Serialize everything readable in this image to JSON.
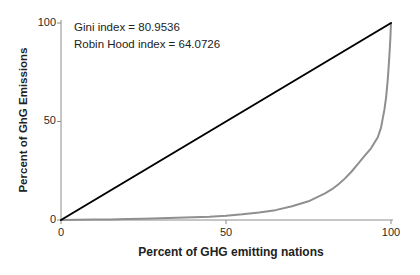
{
  "chart_data": {
    "type": "line",
    "title": "",
    "xlabel": "Percent of GHG emitting nations",
    "ylabel": "Percent of GhG Emissions",
    "xlim": [
      0,
      100
    ],
    "ylim": [
      0,
      100
    ],
    "xticks": [
      0,
      50,
      100
    ],
    "yticks": [
      0,
      50,
      100
    ],
    "grid": false,
    "legend": "none",
    "axis_color": "#8c8c8c",
    "annotations": [
      {
        "text": "Gini index = 80.9536"
      },
      {
        "text": "Robin Hood index = 64.0726"
      }
    ],
    "indices": {
      "gini_index": 80.9536,
      "robin_hood_index": 64.0726
    },
    "series": [
      {
        "name": "lorenz-curve",
        "color": "#8f8f8f",
        "width": 2,
        "x": [
          0,
          5,
          10,
          15,
          20,
          25,
          30,
          35,
          40,
          45,
          50,
          55,
          60,
          65,
          70,
          75,
          80,
          82,
          84,
          86,
          88,
          90,
          92,
          94,
          96,
          97,
          98,
          98.5,
          99,
          99.3,
          99.6,
          99.8,
          100
        ],
        "y": [
          0,
          0.1,
          0.2,
          0.3,
          0.45,
          0.65,
          0.9,
          1.15,
          1.4,
          1.7,
          2.2,
          2.9,
          3.8,
          5,
          7,
          9.5,
          13.5,
          15.5,
          18,
          21,
          24.5,
          28.5,
          32.5,
          36.5,
          42,
          47,
          56,
          62,
          71,
          78,
          86,
          92,
          100
        ]
      },
      {
        "name": "line-of-equality",
        "color": "#000000",
        "width": 2,
        "x": [
          0,
          100
        ],
        "y": [
          0,
          100
        ]
      }
    ]
  }
}
